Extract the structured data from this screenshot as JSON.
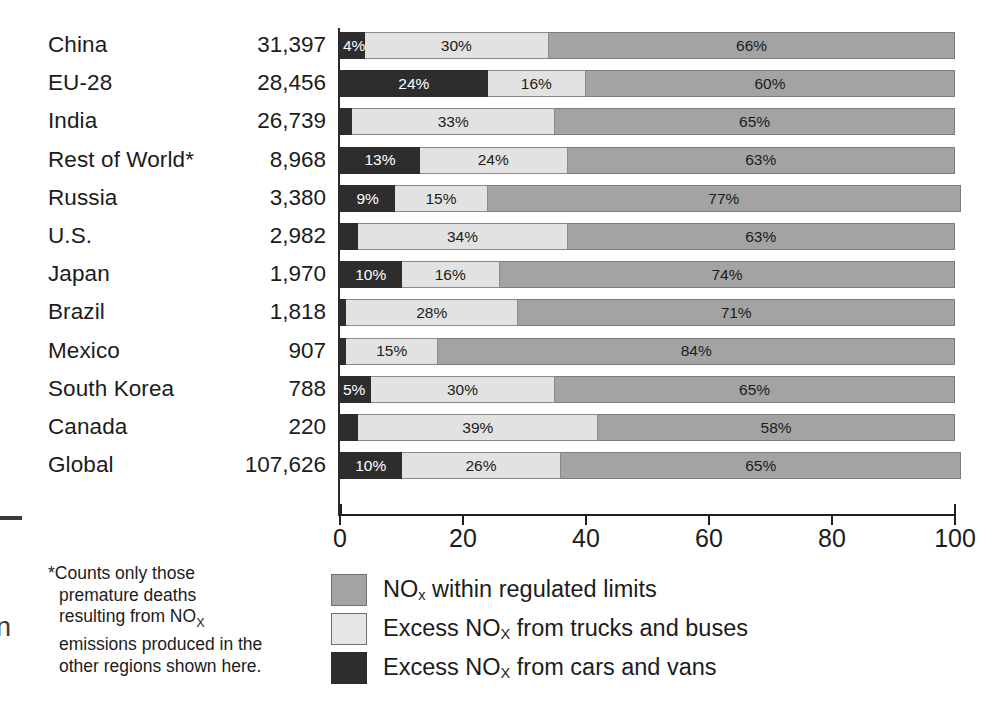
{
  "chart_data": {
    "type": "bar",
    "subtype": "stacked-horizontal-100pct",
    "title": "",
    "xlabel": "",
    "ylabel": "",
    "xlim": [
      0,
      100
    ],
    "xticks": [
      0,
      20,
      40,
      60,
      80,
      100
    ],
    "xtick_labels": [
      "0",
      "20",
      "40",
      "60",
      "80",
      "100"
    ],
    "grid": false,
    "legend_position": "bottom-center",
    "value_column_header": "",
    "categories": [
      "China",
      "EU-28",
      "India",
      "Rest of World*",
      "Russia",
      "U.S.",
      "Japan",
      "Brazil",
      "Mexico",
      "South Korea",
      "Canada",
      "Global"
    ],
    "values": [
      "31,397",
      "28,456",
      "26,739",
      "8,968",
      "3,380",
      "2,982",
      "1,970",
      "1,818",
      "907",
      "788",
      "220",
      "107,626"
    ],
    "series": [
      {
        "name": "Excess NOx from cars and vans",
        "color": "#2d2d2d",
        "values": [
          4,
          24,
          2,
          13,
          9,
          3,
          10,
          1,
          1,
          5,
          3,
          10
        ],
        "labels": [
          "4%",
          "24%",
          "",
          "13%",
          "9%",
          "",
          "10%",
          "",
          "",
          "5%",
          "",
          "10%"
        ]
      },
      {
        "name": "Excess NOx from trucks and buses",
        "color": "#e2e2e2",
        "values": [
          30,
          16,
          33,
          24,
          15,
          34,
          16,
          28,
          15,
          30,
          39,
          26
        ],
        "labels": [
          "30%",
          "16%",
          "33%",
          "24%",
          "15%",
          "34%",
          "16%",
          "28%",
          "15%",
          "30%",
          "39%",
          "26%"
        ]
      },
      {
        "name": "NOx within regulated limits",
        "color": "#a3a3a3",
        "values": [
          66,
          60,
          65,
          63,
          77,
          63,
          74,
          71,
          84,
          65,
          58,
          65
        ],
        "labels": [
          "66%",
          "60%",
          "65%",
          "63%",
          "77%",
          "63%",
          "74%",
          "71%",
          "84%",
          "65%",
          "58%",
          "65%"
        ]
      }
    ]
  },
  "rows": [
    {
      "label": "China",
      "value": "31,397",
      "cars": 4,
      "trucks": 30,
      "within": 66,
      "cars_label": "4%",
      "trucks_label": "30%",
      "within_label": "66%",
      "cars_label_align": "left"
    },
    {
      "label": "EU-28",
      "value": "28,456",
      "cars": 24,
      "trucks": 16,
      "within": 60,
      "cars_label": "24%",
      "trucks_label": "16%",
      "within_label": "60%",
      "cars_label_align": "center"
    },
    {
      "label": "India",
      "value": "26,739",
      "cars": 2,
      "trucks": 33,
      "within": 65,
      "cars_label": "",
      "trucks_label": "33%",
      "within_label": "65%",
      "cars_label_align": "center"
    },
    {
      "label": "Rest of World*",
      "value": "8,968",
      "cars": 13,
      "trucks": 24,
      "within": 63,
      "cars_label": "13%",
      "trucks_label": "24%",
      "within_label": "63%",
      "cars_label_align": "center"
    },
    {
      "label": "Russia",
      "value": "3,380",
      "cars": 9,
      "trucks": 15,
      "within": 77,
      "cars_label": "9%",
      "trucks_label": "15%",
      "within_label": "77%",
      "cars_label_align": "center"
    },
    {
      "label": "U.S.",
      "value": "2,982",
      "cars": 3,
      "trucks": 34,
      "within": 63,
      "cars_label": "",
      "trucks_label": "34%",
      "within_label": "63%",
      "cars_label_align": "center"
    },
    {
      "label": "Japan",
      "value": "1,970",
      "cars": 10,
      "trucks": 16,
      "within": 74,
      "cars_label": "10%",
      "trucks_label": "16%",
      "within_label": "74%",
      "cars_label_align": "center"
    },
    {
      "label": "Brazil",
      "value": "1,818",
      "cars": 1,
      "trucks": 28,
      "within": 71,
      "cars_label": "",
      "trucks_label": "28%",
      "within_label": "71%",
      "cars_label_align": "center"
    },
    {
      "label": "Mexico",
      "value": "907",
      "cars": 1,
      "trucks": 15,
      "within": 84,
      "cars_label": "",
      "trucks_label": "15%",
      "within_label": "84%",
      "cars_label_align": "center"
    },
    {
      "label": "South Korea",
      "value": "788",
      "cars": 5,
      "trucks": 30,
      "within": 65,
      "cars_label": "5%",
      "trucks_label": "30%",
      "within_label": "65%",
      "cars_label_align": "left"
    },
    {
      "label": "Canada",
      "value": "220",
      "cars": 3,
      "trucks": 39,
      "within": 58,
      "cars_label": "",
      "trucks_label": "39%",
      "within_label": "58%",
      "cars_label_align": "center"
    },
    {
      "label": "Global",
      "value": "107,626",
      "cars": 10,
      "trucks": 26,
      "within": 65,
      "cars_label": "10%",
      "trucks_label": "26%",
      "within_label": "65%",
      "cars_label_align": "center"
    }
  ],
  "axis": {
    "ticks": [
      "0",
      "20",
      "40",
      "60",
      "80",
      "100"
    ]
  },
  "footnote": {
    "lines": [
      "*Counts only those",
      "premature deaths",
      "resulting from NO",
      "emissions produced in the",
      "other regions shown here."
    ],
    "subscript": "X",
    "full_text": "*Counts only those premature deaths resulting from NOx emissions produced in the other regions shown here."
  },
  "legend": {
    "items": [
      {
        "swatch": "sw-within",
        "prefix": "NO",
        "sub": "x",
        "suffix": " within regulated limits",
        "color": "#a3a3a3",
        "full_text": "NOx within regulated limits"
      },
      {
        "swatch": "sw-trucks",
        "prefix": "Excess NO",
        "sub": "X",
        "suffix": " from trucks and buses",
        "color": "#e6e6e6",
        "full_text": "Excess NOx from trucks and buses"
      },
      {
        "swatch": "sw-cars",
        "prefix": "Excess NO",
        "sub": "X",
        "suffix": " from cars and vans",
        "color": "#2d2d2d",
        "full_text": "Excess NOx from cars and vans"
      }
    ]
  },
  "edge": {
    "glyph": "n"
  }
}
